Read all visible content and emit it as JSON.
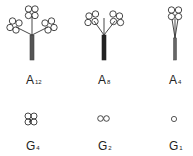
{
  "colors": {
    "stroke": "#333333",
    "stem": "#444444",
    "text": "#222222"
  },
  "figures": [
    {
      "id": "A12",
      "letter": "A",
      "sub": "12",
      "label_x": 26,
      "label_y": 74
    },
    {
      "id": "A8",
      "letter": "A",
      "sub": "8",
      "label_x": 98,
      "label_y": 74
    },
    {
      "id": "A4",
      "letter": "A",
      "sub": "4",
      "label_x": 169,
      "label_y": 74
    },
    {
      "id": "G4",
      "letter": "G",
      "sub": "4",
      "label_x": 26,
      "label_y": 140
    },
    {
      "id": "G2",
      "letter": "G",
      "sub": "2",
      "label_x": 98,
      "label_y": 140
    },
    {
      "id": "G1",
      "letter": "G",
      "sub": "1",
      "label_x": 169,
      "label_y": 140
    }
  ]
}
